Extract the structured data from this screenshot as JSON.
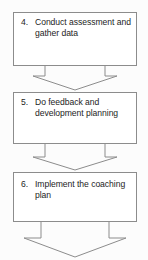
{
  "diagram": {
    "orientation": "vertical-top-to-bottom",
    "background_color": "#fcfcfc",
    "line_color": "#8c8c8c",
    "text_color": "#1d1d1d",
    "steps": [
      {
        "number": "4.",
        "label": "Conduct assessment and gather data"
      },
      {
        "number": "5.",
        "label": "Do feedback and development planning"
      },
      {
        "number": "6.",
        "label": "Implement the coaching plan"
      }
    ],
    "connectors": [
      {
        "name": "arrow-4-to-5",
        "shape": "block-arrow-down"
      },
      {
        "name": "arrow-5-to-6",
        "shape": "block-arrow-down"
      },
      {
        "name": "arrow-6-to-next",
        "shape": "block-arrow-down"
      }
    ]
  }
}
